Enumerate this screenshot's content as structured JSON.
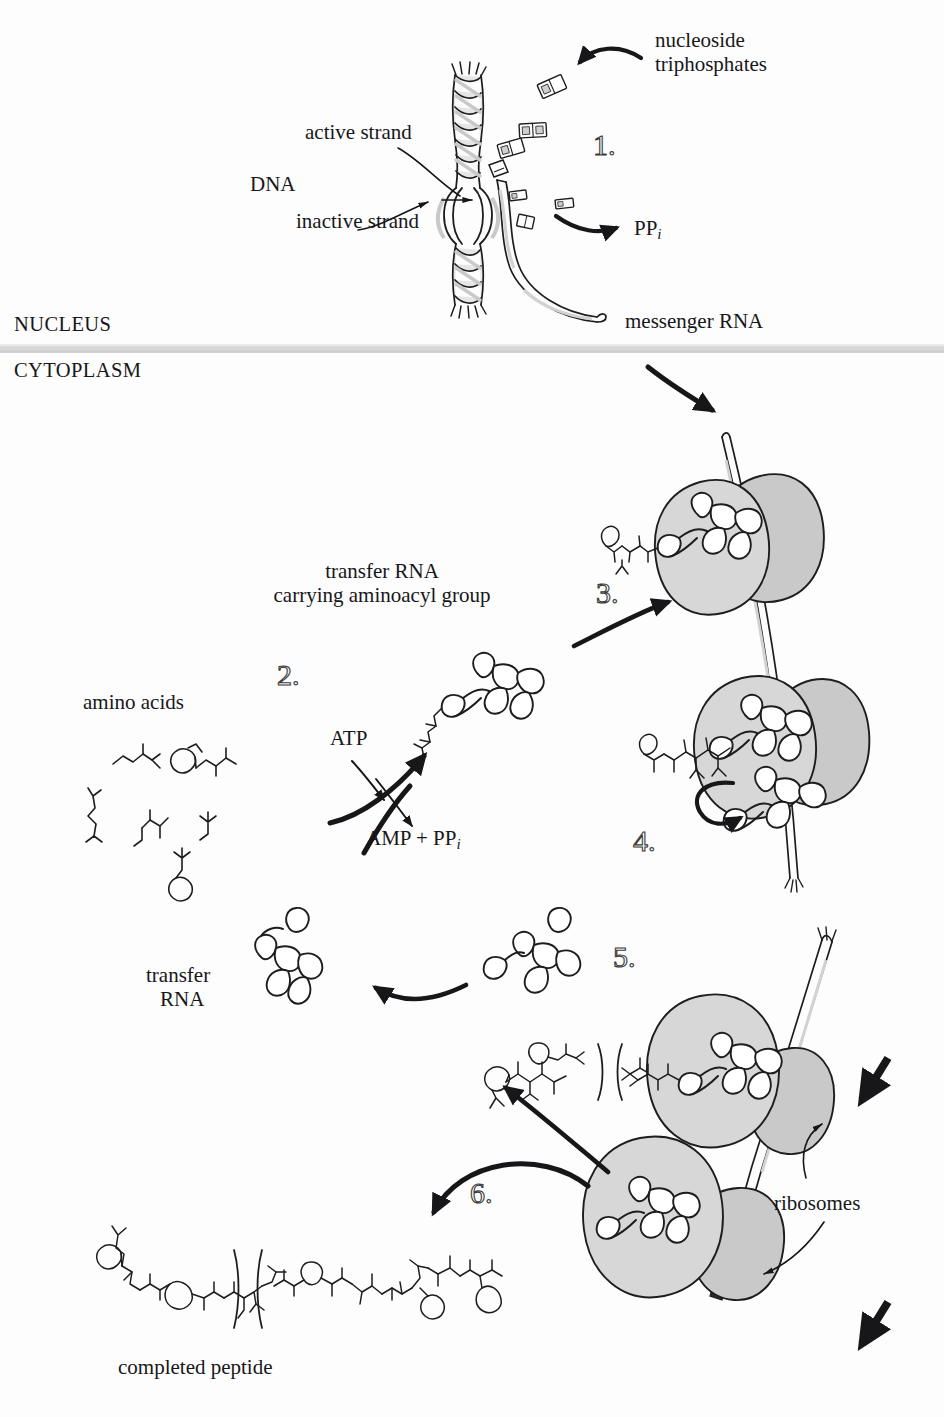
{
  "figure": {
    "title_visible": false,
    "kind": "protein-synthesis-schematic",
    "compartments": {
      "nucleus": "NUCLEUS",
      "cytoplasm": "CYTOPLASM"
    },
    "labels": {
      "nucleoside_triphosphates_line1": "nucleoside",
      "nucleoside_triphosphates_line2": "triphosphates",
      "active_strand": "active strand",
      "inactive_strand": "inactive strand",
      "dna": "DNA",
      "pyrophosphate": "PP",
      "pyrophosphate_sub": "i",
      "messenger_rna": "messenger RNA",
      "trna_aminoacyl_line1": "transfer RNA",
      "trna_aminoacyl_line2": "carrying aminoacyl group",
      "amino_acids": "amino acids",
      "atp": "ATP",
      "amp_pp_prefix": "AMP + PP",
      "amp_pp_sub": "i",
      "transfer_rna_line1": "transfer",
      "transfer_rna_line2": "RNA",
      "ribosomes": "ribosomes",
      "completed_peptide": "completed peptide"
    },
    "steps": [
      {
        "id": "step-1",
        "label": "1."
      },
      {
        "id": "step-2",
        "label": "2."
      },
      {
        "id": "step-3",
        "label": "3."
      },
      {
        "id": "step-4",
        "label": "4."
      },
      {
        "id": "step-5",
        "label": "5."
      },
      {
        "id": "step-6",
        "label": "6."
      }
    ],
    "colors": {
      "ink": "#17171a",
      "ribosome_fill": "#d7d7d7",
      "ribosome_fill_dark": "#c9c9c9",
      "dna_fill": "#e3e3e3",
      "membrane_band": "#d6d6d6",
      "paper": "#fdfdfd",
      "stroke": "#1d1d20"
    }
  }
}
